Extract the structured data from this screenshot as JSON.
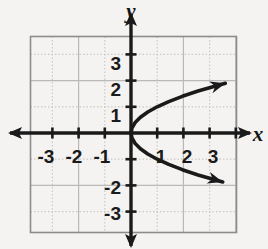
{
  "figure": {
    "name": "sideways-parabola-graph",
    "background_color": "#f4f3f1",
    "ink_color": "#1a1a1a",
    "grid_solid_color": "#b9b9b9",
    "grid_dotted_color": "#c9c9c9",
    "frame_color": "#8c8c8c"
  },
  "axes": {
    "x_label": "x",
    "y_label": "y",
    "x_tick_labels": [
      "-3",
      "-2",
      "-1",
      "1",
      "2",
      "3"
    ],
    "y_tick_labels": [
      "3",
      "2",
      "1",
      "-2",
      "-3"
    ],
    "arrowheads": [
      "left",
      "right",
      "up",
      "down"
    ]
  },
  "chart_data": {
    "type": "line",
    "title": "",
    "xlabel": "x",
    "ylabel": "y",
    "xlim": [
      -4,
      4
    ],
    "ylim": [
      -3.75,
      3.75
    ],
    "grid": true,
    "legend": "none",
    "equation": "x = y^2",
    "vertex": [
      0,
      0
    ],
    "opens": "right",
    "series": [
      {
        "name": "x = y squared",
        "x": [
          3.6,
          2.56,
          1.96,
          1.44,
          1.0,
          0.64,
          0.36,
          0.16,
          0.04,
          0.0,
          0.04,
          0.16,
          0.36,
          0.64,
          1.0,
          1.44,
          1.96,
          2.56,
          3.5
        ],
        "y": [
          1.9,
          1.6,
          1.4,
          1.2,
          1.0,
          0.8,
          0.6,
          0.4,
          0.2,
          0.0,
          -0.2,
          -0.4,
          -0.6,
          -0.8,
          -1.0,
          -1.2,
          -1.4,
          -1.6,
          -1.87
        ]
      }
    ],
    "xticks": [
      -3,
      -2,
      -1,
      1,
      2,
      3
    ],
    "yticks": [
      3,
      2,
      1,
      -2,
      -3
    ]
  }
}
